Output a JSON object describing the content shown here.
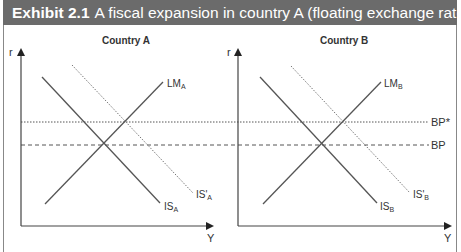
{
  "header": {
    "exhibit_number": "Exhibit 2.1",
    "title": "A fiscal expansion in country A (floating exchange rates)",
    "background": "#6b6b6b"
  },
  "panels": [
    {
      "title": "Country A",
      "y_axis_label": "r",
      "x_axis_label": "Y",
      "curves": {
        "lm": "LM",
        "lm_sub": "A",
        "is": "IS",
        "is_sub": "A",
        "is_shift": "IS'",
        "is_shift_sub": "A"
      }
    },
    {
      "title": "Country B",
      "y_axis_label": "r",
      "x_axis_label": "Y",
      "curves": {
        "lm": "LM",
        "lm_sub": "B",
        "is": "IS",
        "is_sub": "B",
        "is_shift": "IS'",
        "is_shift_sub": "B"
      }
    }
  ],
  "bp_lines": {
    "bp_star": "BP*",
    "bp": "BP"
  }
}
